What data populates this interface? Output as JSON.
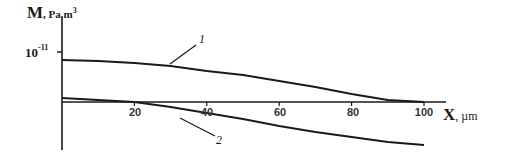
{
  "chart_data": {
    "type": "line",
    "title": "",
    "xlabel": "X",
    "xlabel_unit": "µm",
    "ylabel": "M",
    "ylabel_unit": "Pa m",
    "ylabel_unit_exp": "3",
    "xlim": [
      0,
      105
    ],
    "x_ticks": [
      20,
      40,
      60,
      80,
      100
    ],
    "y_ticks": [
      {
        "base": "10",
        "exp": "-11"
      }
    ],
    "grid": false,
    "legend": "inline curve labels",
    "series": [
      {
        "name": "1",
        "x": [
          0,
          10,
          20,
          30,
          40,
          50,
          60,
          70,
          80,
          90,
          100
        ],
        "y_px_above_axis": [
          42,
          41,
          39,
          36,
          31,
          27,
          21,
          15,
          8,
          2,
          0
        ]
      },
      {
        "name": "2",
        "x": [
          0,
          10,
          20,
          30,
          40,
          50,
          60,
          70,
          80,
          90,
          100
        ],
        "y_px_above_axis": [
          4,
          2,
          0,
          -5,
          -11,
          -17,
          -24,
          -30,
          -35,
          -40,
          -43
        ]
      }
    ]
  },
  "labels": {
    "ylabel": "M",
    "ylabel_unit": ", Pa m",
    "ylabel_exp": "3",
    "ytick_base": "10",
    "ytick_exp": "-11",
    "xlabel": "X",
    "xlabel_unit": ", µm",
    "xticks": [
      "20",
      "40",
      "60",
      "80",
      "100"
    ],
    "curve1": "1",
    "curve2": "2"
  },
  "colors": {
    "line": "#1a1a1a",
    "background": "#ffffff"
  }
}
